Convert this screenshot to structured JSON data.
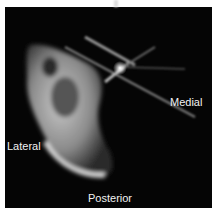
{
  "figure": {
    "type": "CT cross-section scan",
    "labels": {
      "medial": "Medial",
      "lateral": "Lateral",
      "posterior": "Posterior"
    }
  }
}
